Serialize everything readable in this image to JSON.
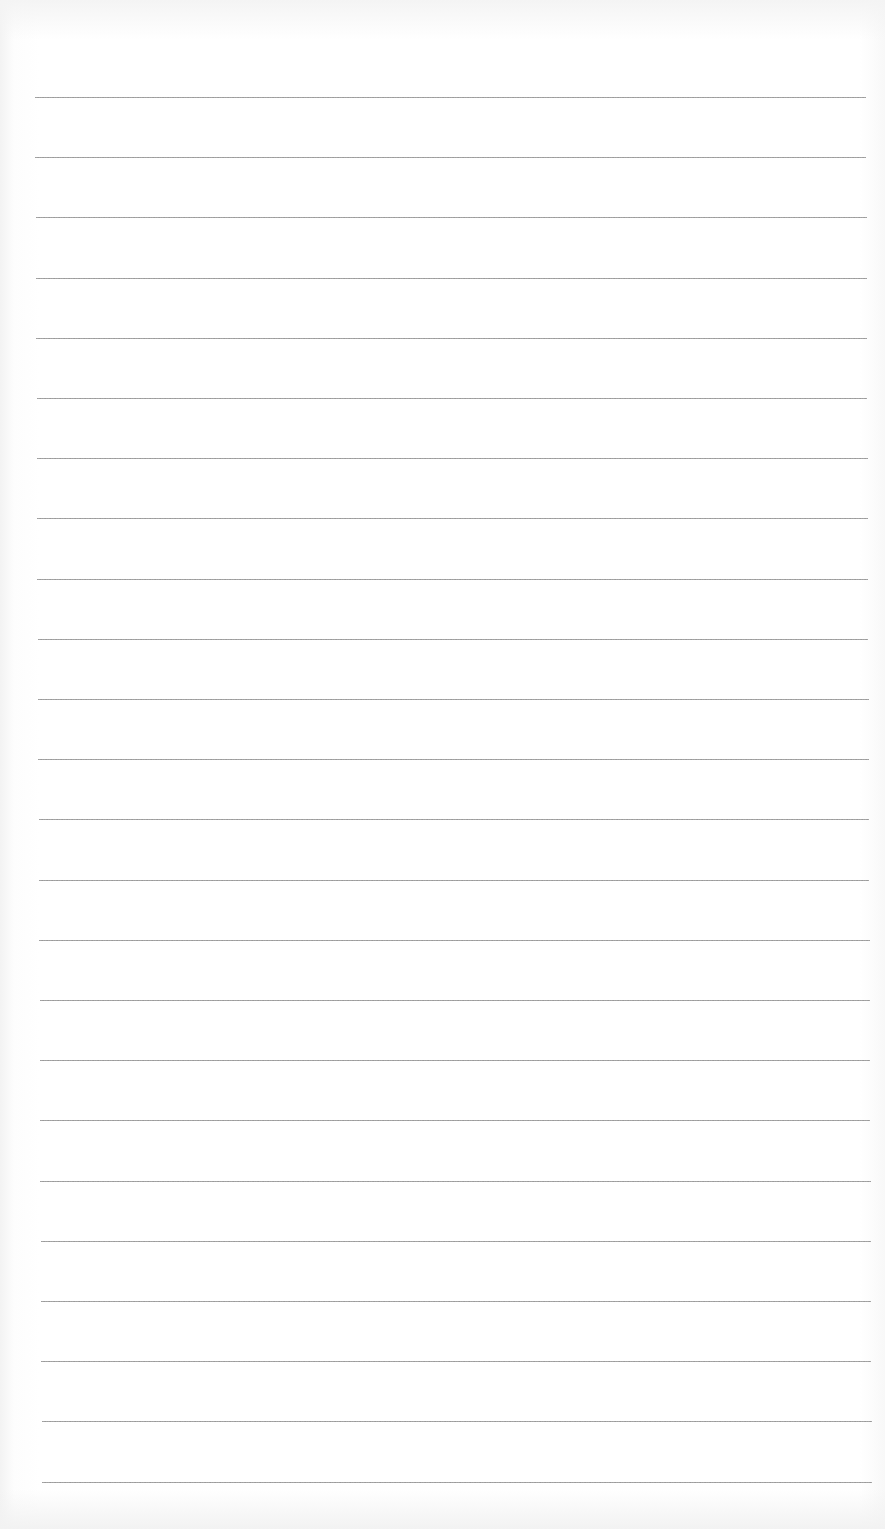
{
  "page": {
    "type": "lined-paper",
    "background_color": "#ffffff",
    "line_color": "#8c8c8c",
    "line_count": 24,
    "first_line_y": 97,
    "line_spacing": 60.2,
    "left_start": 35,
    "left_end": 42,
    "right_start": 866,
    "right_end": 872
  }
}
